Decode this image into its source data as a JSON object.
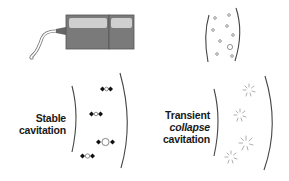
{
  "diagram": {
    "colors": {
      "transducer_body": "#7a7a7a",
      "transducer_window": "#c8c8c8",
      "transducer_outline": "#555555",
      "wavefront": "#444444",
      "bubble": "#888888",
      "oscillation_dot": "#111111",
      "burst": "#999999"
    },
    "panels": {
      "transducer": {
        "name": "ultrasound-transducer"
      },
      "bubbles": {
        "name": "microbubbles-in-field"
      },
      "stable": {
        "line1": "Stable",
        "line2": "cavitation"
      },
      "transient": {
        "line1": "Transient",
        "line2": "collapse",
        "line3": "cavitation"
      }
    }
  }
}
